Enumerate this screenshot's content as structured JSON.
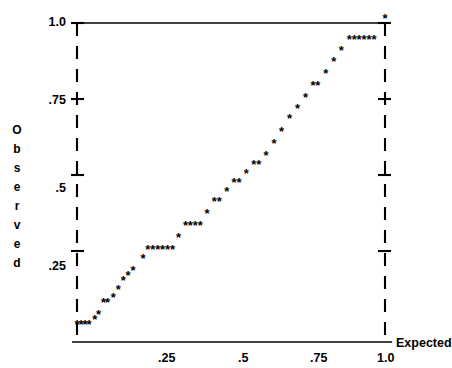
{
  "figure": {
    "type": "pp-plot",
    "axis_color": "#000000",
    "point_color": "#000000",
    "y_axis_title": "Observed",
    "y_axis_title_letters": [
      "O",
      "b",
      "s",
      "e",
      "r",
      "v",
      "e",
      "d"
    ],
    "x_axis_title": "Expected",
    "y_ticks": [
      "1.0",
      ".75",
      ".5",
      ".25"
    ],
    "x_ticks": [
      ".25",
      ".5",
      ".75",
      "1.0"
    ]
  },
  "chart_data": {
    "type": "scatter",
    "title": "",
    "xlabel": "Expected",
    "ylabel": "Observed",
    "xlim": [
      0,
      1.0
    ],
    "ylim": [
      0,
      1.0
    ],
    "xticks": [
      0.25,
      0.5,
      0.75,
      1.0
    ],
    "xticklabels": [
      ".25",
      ".5",
      ".75",
      "1.0"
    ],
    "yticks": [
      0.25,
      0.5,
      0.75,
      1.0
    ],
    "yticklabels": [
      ".25",
      ".5",
      ".75",
      "1.0"
    ],
    "grid": false,
    "legend": null,
    "marker": "asterisk",
    "axis_style": {
      "left": "dashed",
      "right": "dashed",
      "top": "solid",
      "bottom": "solid"
    },
    "points": [
      [
        0.0,
        0.005
      ],
      [
        0.013,
        0.005
      ],
      [
        0.026,
        0.005
      ],
      [
        0.039,
        0.005
      ],
      [
        0.058,
        0.02
      ],
      [
        0.07,
        0.037
      ],
      [
        0.086,
        0.075
      ],
      [
        0.099,
        0.075
      ],
      [
        0.118,
        0.094
      ],
      [
        0.134,
        0.118
      ],
      [
        0.15,
        0.15
      ],
      [
        0.166,
        0.166
      ],
      [
        0.182,
        0.182
      ],
      [
        0.214,
        0.222
      ],
      [
        0.23,
        0.25
      ],
      [
        0.246,
        0.25
      ],
      [
        0.262,
        0.25
      ],
      [
        0.278,
        0.25
      ],
      [
        0.294,
        0.25
      ],
      [
        0.31,
        0.25
      ],
      [
        0.33,
        0.29
      ],
      [
        0.352,
        0.33
      ],
      [
        0.368,
        0.33
      ],
      [
        0.384,
        0.33
      ],
      [
        0.4,
        0.33
      ],
      [
        0.422,
        0.37
      ],
      [
        0.446,
        0.41
      ],
      [
        0.462,
        0.41
      ],
      [
        0.486,
        0.44
      ],
      [
        0.51,
        0.47
      ],
      [
        0.526,
        0.47
      ],
      [
        0.55,
        0.5
      ],
      [
        0.574,
        0.53
      ],
      [
        0.59,
        0.53
      ],
      [
        0.614,
        0.56
      ],
      [
        0.64,
        0.6
      ],
      [
        0.664,
        0.64
      ],
      [
        0.69,
        0.68
      ],
      [
        0.716,
        0.716
      ],
      [
        0.742,
        0.752
      ],
      [
        0.766,
        0.79
      ],
      [
        0.782,
        0.79
      ],
      [
        0.808,
        0.83
      ],
      [
        0.834,
        0.87
      ],
      [
        0.858,
        0.905
      ],
      [
        0.884,
        0.94
      ],
      [
        0.9,
        0.94
      ],
      [
        0.916,
        0.94
      ],
      [
        0.932,
        0.94
      ],
      [
        0.948,
        0.94
      ],
      [
        0.964,
        0.94
      ],
      [
        1.0,
        1.01
      ]
    ]
  }
}
